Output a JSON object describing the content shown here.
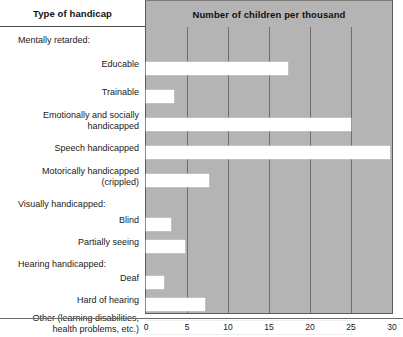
{
  "header": {
    "left_title": "Type of handicap",
    "right_title": "Number of children per thousand"
  },
  "chart_data": {
    "type": "bar",
    "orientation": "horizontal",
    "title": "Number of children per thousand",
    "xlabel": "Number of children per thousand",
    "ylabel": "Type of handicap",
    "xlim": [
      0,
      30
    ],
    "xticks": [
      0,
      5,
      10,
      15,
      20,
      25,
      30
    ],
    "xtick_labels": [
      "0",
      "5",
      "10",
      "15",
      "20",
      "25",
      "30"
    ],
    "grid": true,
    "legend": "none",
    "plot_background": "#b4b4b4",
    "bar_color": "#ffffff",
    "categories": [
      "Mentally retarded:",
      "Educable",
      "Trainable",
      "Emotionally and socially handicapped",
      "Speech handicapped",
      "Motorically handicapped (crippled)",
      "Visually handicapped:",
      "Blind",
      "Partially seeing",
      "Hearing handicapped:",
      "Deaf",
      "Hard of hearing",
      "Other (learning disabilities, health problems, etc.)"
    ],
    "values": [
      null,
      17.3,
      3.4,
      25.0,
      29.8,
      7.7,
      null,
      3.1,
      4.7,
      null,
      2.2,
      7.2,
      25.0
    ]
  },
  "rows": [
    {
      "label": "Mentally retarded:",
      "is_group": true,
      "value": null,
      "top": 11,
      "label_top": 8
    },
    {
      "label": "Educable",
      "is_group": false,
      "value": 17.3,
      "top": 35,
      "label_top": 32
    },
    {
      "label": "Trainable",
      "is_group": false,
      "value": 3.4,
      "top": 63,
      "label_top": 60
    },
    {
      "label": "Emotionally and socially\nhandicapped",
      "is_group": false,
      "value": 25.0,
      "top": 91,
      "label_top": 83
    },
    {
      "label": "Speech handicapped",
      "is_group": false,
      "value": 29.8,
      "top": 119,
      "label_top": 116
    },
    {
      "label": "Motorically handicapped\n(crippled)",
      "is_group": false,
      "value": 7.7,
      "top": 147,
      "label_top": 139
    },
    {
      "label": "Visually handicapped:",
      "is_group": true,
      "value": null,
      "top": 175,
      "label_top": 172
    },
    {
      "label": "Blind",
      "is_group": false,
      "value": 3.1,
      "top": 191,
      "label_top": 188
    },
    {
      "label": "Partially seeing",
      "is_group": false,
      "value": 4.7,
      "top": 213,
      "label_top": 210
    },
    {
      "label": "Hearing handicapped:",
      "is_group": true,
      "value": null,
      "top": 235,
      "label_top": 232
    },
    {
      "label": "Deaf",
      "is_group": false,
      "value": 2.2,
      "top": 249,
      "label_top": 246
    },
    {
      "label": "Hard of hearing",
      "is_group": false,
      "value": 7.2,
      "top": 271,
      "label_top": 268
    },
    {
      "label": "Other (learning disabilities,\nhealth problems, etc.)",
      "is_group": false,
      "value": 25.0,
      "top": 294,
      "label_top": 286
    }
  ]
}
